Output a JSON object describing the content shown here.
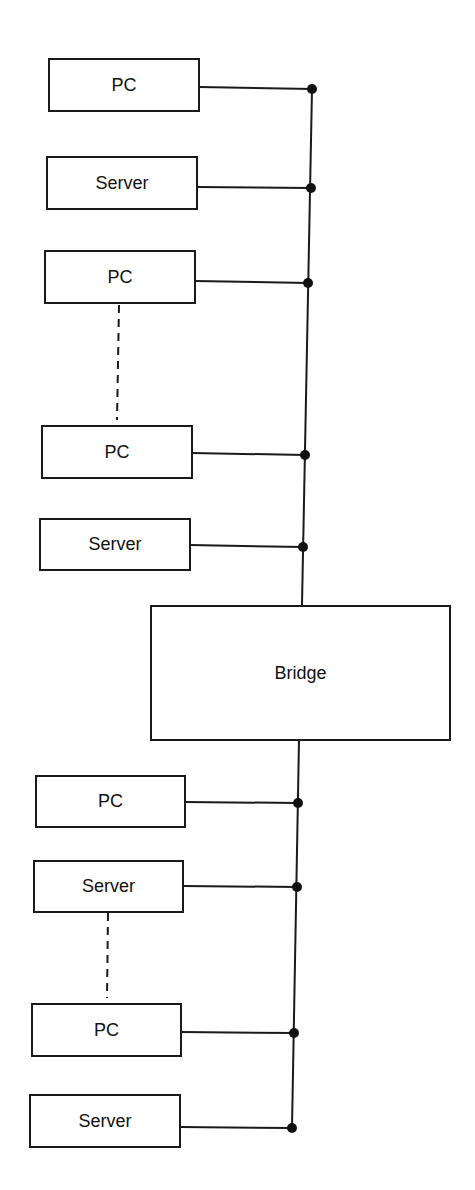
{
  "diagram": {
    "title": "",
    "segments": [
      {
        "name": "upper-segment",
        "nodes": [
          {
            "label": "PC"
          },
          {
            "label": "Server"
          },
          {
            "label": "PC"
          },
          {
            "label": "PC"
          },
          {
            "label": "Server"
          }
        ],
        "ellipsis_between": [
          2,
          3
        ]
      },
      {
        "name": "lower-segment",
        "nodes": [
          {
            "label": "PC"
          },
          {
            "label": "Server"
          },
          {
            "label": "PC"
          },
          {
            "label": "Server"
          }
        ],
        "ellipsis_between": [
          1,
          2
        ]
      }
    ],
    "bridge": {
      "label": "Bridge"
    },
    "colors": {
      "line": "#1a1a1a",
      "background": "#ffffff"
    }
  }
}
